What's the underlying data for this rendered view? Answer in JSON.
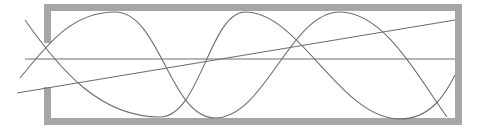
{
  "diagram": {
    "colors": {
      "background": "#ffffff",
      "frame": "#a6a6a6",
      "lines": "#6e6e6e"
    },
    "frame": {
      "left": 44,
      "top": 4,
      "right": 462,
      "bottom": 125,
      "thickness": 7,
      "left_gap": {
        "from_y": 43,
        "to_y": 87
      }
    },
    "curves": [
      {
        "name": "wave-a",
        "path": "M20,78 C45,48 70,12 115,12 C160,12 170,118 215,118 C265,118 290,12 340,12 C385,12 420,80 447,117"
      },
      {
        "name": "wave-b",
        "path": "M25,20 C60,70 100,117 160,117 C200,117 210,12 245,12 C300,12 340,119 400,119 C430,119 445,95 455,75"
      },
      {
        "name": "straight-diagonal",
        "path": "M17,93 L455,20"
      },
      {
        "name": "horizontal-axis",
        "path": "M25,59 L455,59"
      }
    ]
  }
}
